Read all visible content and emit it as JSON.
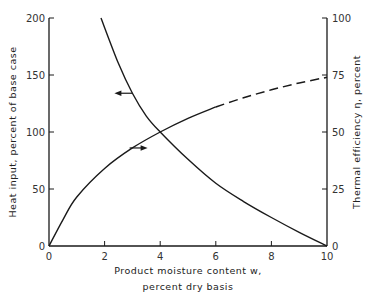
{
  "chart_data": {
    "type": "line",
    "title": "",
    "xlabel": "Product moisture content w, percent dry basis",
    "xlabel_line1": "Product moisture content w,",
    "xlabel_line2": "percent dry basis",
    "ylabel_left": "Heat input, percent of base case",
    "ylabel_right": "Thermal efficiency η, percent",
    "xlim": [
      0,
      10
    ],
    "ylim_left": [
      0,
      200
    ],
    "ylim_right": [
      0,
      100
    ],
    "x_ticks": [
      "0",
      "2",
      "4",
      "6",
      "8",
      "10"
    ],
    "y_ticks_left": [
      "0",
      "50",
      "100",
      "150",
      "200"
    ],
    "y_ticks_right": [
      "0",
      "25",
      "50",
      "75",
      "100"
    ],
    "grid": false,
    "legend": "none (arrows indicate axis for each curve)",
    "series": [
      {
        "name": "Heat input",
        "axis": "left",
        "style": "solid",
        "x": [
          1.87,
          2.5,
          3.0,
          3.5,
          4.0,
          5.0,
          6.0,
          7.0,
          8.0,
          9.0,
          10.0
        ],
        "values": [
          200,
          160,
          134,
          114,
          100,
          76,
          55,
          39,
          25,
          12,
          0
        ]
      },
      {
        "name": "Thermal efficiency",
        "axis": "right",
        "style": "solid to 6, dashed 6–10",
        "x": [
          0,
          0.5,
          1.0,
          2.0,
          3.0,
          4.0,
          5.0,
          6.0,
          7.0,
          8.0,
          9.0,
          10.0
        ],
        "values": [
          0,
          11.5,
          21.5,
          34,
          43,
          50,
          56,
          61,
          65,
          68.5,
          71.5,
          74
        ]
      }
    ],
    "annotations": [
      {
        "type": "arrow",
        "direction": "left",
        "at": {
          "x": 3.0,
          "y_left": 134
        },
        "meaning": "heat input curve reads on left axis"
      },
      {
        "type": "arrow",
        "direction": "right",
        "at": {
          "x": 2.9,
          "y_right": 43
        },
        "meaning": "efficiency curve reads on right axis"
      }
    ]
  }
}
